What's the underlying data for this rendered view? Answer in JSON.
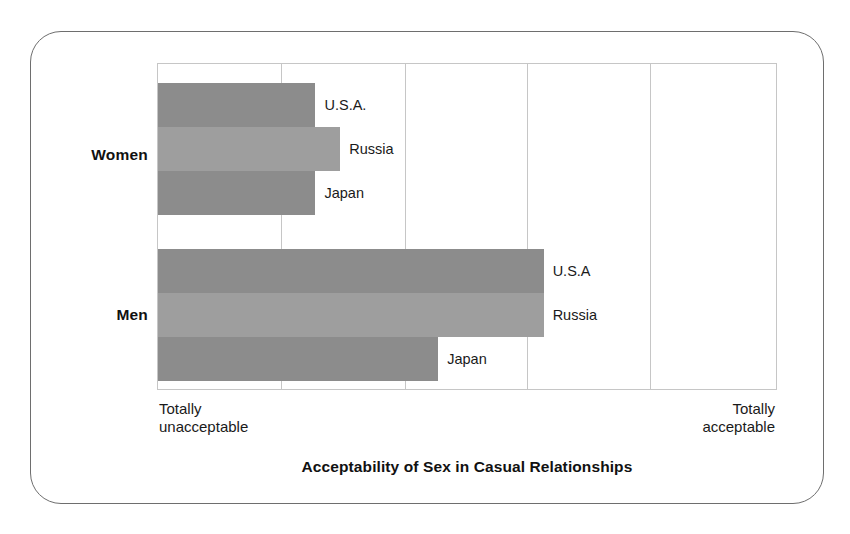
{
  "chart_data": {
    "type": "bar",
    "orientation": "horizontal",
    "title": "Acceptability of Sex in Casual Relationships",
    "xlabel": "",
    "ylabel": "",
    "xlim": [
      0,
      5
    ],
    "grid": true,
    "gridlines_x": [
      1,
      2,
      3,
      4
    ],
    "legend": "none",
    "axis_end_labels": {
      "left": "Totally\nunacceptable",
      "right": "Totally\nacceptable"
    },
    "groups": [
      {
        "name": "Women",
        "bars": [
          {
            "label": "U.S.A.",
            "value": 1.27,
            "color": "#8c8c8c"
          },
          {
            "label": "Russia",
            "value": 1.47,
            "color": "#9e9e9e"
          },
          {
            "label": "Japan",
            "value": 1.27,
            "color": "#8c8c8c"
          }
        ]
      },
      {
        "name": "Men",
        "bars": [
          {
            "label": "U.S.A",
            "value": 3.11,
            "color": "#8c8c8c"
          },
          {
            "label": "Russia",
            "value": 3.11,
            "color": "#9e9e9e"
          },
          {
            "label": "Japan",
            "value": 2.26,
            "color": "#8c8c8c"
          }
        ]
      }
    ],
    "colors": {
      "bar_dark": "#8c8c8c",
      "bar_light": "#9e9e9e",
      "grid": "#c6c6c6",
      "frame": "#6e6e6e",
      "text": "#1a1a1a",
      "background": "#ffffff"
    }
  }
}
